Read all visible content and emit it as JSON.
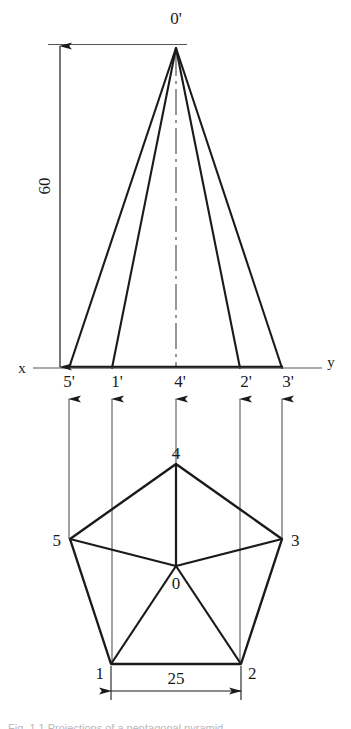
{
  "drawing": {
    "title": "Orthographic projection of a pentagonal pyramid",
    "stroke_color": "#1a1a1a",
    "thin_color": "#555555",
    "background": "#ffffff"
  },
  "elevation": {
    "apex_label": "0'",
    "axis": {
      "x_label": "x",
      "y_label": "y"
    },
    "base_point_labels": [
      "5'",
      "1'",
      "4'",
      "2'",
      "3'"
    ],
    "height_dimension": {
      "value": "60",
      "rotated": true
    }
  },
  "plan": {
    "vertex_labels": {
      "v1": "1",
      "v2": "2",
      "v3": "3",
      "v4": "4",
      "v5": "5",
      "center": "0"
    },
    "base_dimension": {
      "value": "25"
    }
  },
  "caption": {
    "text": "Fig. 1.1 Projections of a pentagonal pyramid"
  }
}
